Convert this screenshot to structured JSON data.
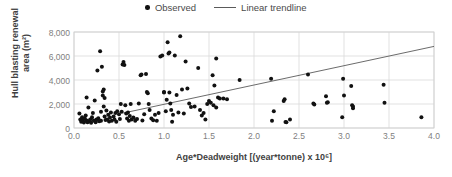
{
  "legend": {
    "position": "top-center",
    "entries": [
      {
        "label": "Observed",
        "marker": "dot",
        "color": "#111111",
        "icon": "scatter-dot-icon"
      },
      {
        "label": "Linear trendline",
        "marker": "line",
        "color": "#5a5a5a",
        "icon": "trendline-icon"
      }
    ]
  },
  "axes": {
    "x": {
      "label": "Age*Deadweight [(year*tonne) x 10⁶]",
      "ticks": [
        "0.0",
        "0.5",
        "1.0",
        "1.5",
        "2.0",
        "2.5",
        "3.0",
        "3.5",
        "4.0"
      ],
      "min": 0.0,
      "max": 4.0
    },
    "y": {
      "label": "Hull blasting renewal area (m²)",
      "ticks": [
        "0",
        "2,000",
        "4,000",
        "6,000",
        "8,000"
      ],
      "min": 0,
      "max": 8000
    }
  },
  "colors": {
    "marker": "#111111",
    "trendline": "#5a5a5a",
    "grid": "#d9d9d9",
    "plot_border": "#d0d0d0",
    "tick_text": "#808080",
    "axis_title": "#3f3f3f",
    "background": "#ffffff"
  },
  "chart_data": {
    "type": "scatter",
    "title": "",
    "xlabel": "Age*Deadweight [(year*tonne) x 10⁶]",
    "ylabel": "Hull blasting renewal area (m²)",
    "xlim": [
      0.0,
      4.0
    ],
    "ylim": [
      0,
      8000
    ],
    "grid": true,
    "legend_position": "top-center",
    "series": [
      {
        "name": "Observed",
        "type": "scatter",
        "marker": "dot",
        "color": "#111111",
        "points": [
          [
            0.06,
            1200
          ],
          [
            0.07,
            700
          ],
          [
            0.08,
            520
          ],
          [
            0.09,
            900
          ],
          [
            0.1,
            600
          ],
          [
            0.11,
            450
          ],
          [
            0.12,
            800
          ],
          [
            0.13,
            1050
          ],
          [
            0.14,
            2550
          ],
          [
            0.14,
            620
          ],
          [
            0.15,
            480
          ],
          [
            0.16,
            1700
          ],
          [
            0.17,
            560
          ],
          [
            0.18,
            700
          ],
          [
            0.19,
            430
          ],
          [
            0.2,
            900
          ],
          [
            0.21,
            1250
          ],
          [
            0.22,
            620
          ],
          [
            0.23,
            2300
          ],
          [
            0.24,
            480
          ],
          [
            0.25,
            700
          ],
          [
            0.26,
            4800
          ],
          [
            0.27,
            820
          ],
          [
            0.28,
            560
          ],
          [
            0.29,
            6400
          ],
          [
            0.3,
            1350
          ],
          [
            0.3,
            600
          ],
          [
            0.31,
            5100
          ],
          [
            0.32,
            2700
          ],
          [
            0.32,
            3050
          ],
          [
            0.33,
            3200
          ],
          [
            0.33,
            1800
          ],
          [
            0.34,
            2500
          ],
          [
            0.34,
            950
          ],
          [
            0.35,
            660
          ],
          [
            0.36,
            1450
          ],
          [
            0.37,
            700
          ],
          [
            0.38,
            1100
          ],
          [
            0.39,
            540
          ],
          [
            0.4,
            880
          ],
          [
            0.41,
            1300
          ],
          [
            0.42,
            600
          ],
          [
            0.44,
            950
          ],
          [
            0.45,
            700
          ],
          [
            0.46,
            1250
          ],
          [
            0.47,
            520
          ],
          [
            0.48,
            1400
          ],
          [
            0.5,
            1150
          ],
          [
            0.51,
            760
          ],
          [
            0.52,
            2000
          ],
          [
            0.53,
            1350
          ],
          [
            0.54,
            5300
          ],
          [
            0.55,
            5500
          ],
          [
            0.56,
            5250
          ],
          [
            0.57,
            1900
          ],
          [
            0.58,
            1200
          ],
          [
            0.59,
            800
          ],
          [
            0.6,
            1300
          ],
          [
            0.61,
            600
          ],
          [
            0.62,
            1000
          ],
          [
            0.63,
            2000
          ],
          [
            0.64,
            700
          ],
          [
            0.66,
            880
          ],
          [
            0.68,
            600
          ],
          [
            0.7,
            750
          ],
          [
            0.72,
            2050
          ],
          [
            0.74,
            4400
          ],
          [
            0.75,
            4450
          ],
          [
            0.76,
            620
          ],
          [
            0.78,
            1150
          ],
          [
            0.8,
            4500
          ],
          [
            0.81,
            3000
          ],
          [
            0.82,
            2900
          ],
          [
            0.83,
            2000
          ],
          [
            0.84,
            1500
          ],
          [
            0.86,
            800
          ],
          [
            0.88,
            650
          ],
          [
            0.9,
            1100
          ],
          [
            0.92,
            600
          ],
          [
            0.94,
            1250
          ],
          [
            0.96,
            5950
          ],
          [
            0.98,
            6050
          ],
          [
            1.0,
            2950
          ],
          [
            1.0,
            3000
          ],
          [
            1.02,
            1400
          ],
          [
            1.03,
            2350
          ],
          [
            1.04,
            7150
          ],
          [
            1.05,
            6200
          ],
          [
            1.06,
            6300
          ],
          [
            1.06,
            2950
          ],
          [
            1.07,
            2050
          ],
          [
            1.08,
            1500
          ],
          [
            1.09,
            520
          ],
          [
            1.1,
            1100
          ],
          [
            1.12,
            6050
          ],
          [
            1.14,
            2750
          ],
          [
            1.16,
            1300
          ],
          [
            1.18,
            7650
          ],
          [
            1.2,
            3200
          ],
          [
            1.22,
            1200
          ],
          [
            1.24,
            5550
          ],
          [
            1.26,
            3300
          ],
          [
            1.28,
            2050
          ],
          [
            1.3,
            1750
          ],
          [
            1.34,
            1800
          ],
          [
            1.38,
            5000
          ],
          [
            1.4,
            1500
          ],
          [
            1.42,
            1050
          ],
          [
            1.44,
            1250
          ],
          [
            1.46,
            700
          ],
          [
            1.48,
            2000
          ],
          [
            1.5,
            2250
          ],
          [
            1.52,
            2100
          ],
          [
            1.54,
            4400
          ],
          [
            1.55,
            1900
          ],
          [
            1.56,
            3550
          ],
          [
            1.58,
            5800
          ],
          [
            1.58,
            1700
          ],
          [
            1.6,
            2550
          ],
          [
            1.62,
            2450
          ],
          [
            1.66,
            2450
          ],
          [
            1.7,
            2400
          ],
          [
            1.84,
            4000
          ],
          [
            2.19,
            4100
          ],
          [
            2.2,
            600
          ],
          [
            2.22,
            1400
          ],
          [
            2.33,
            2250
          ],
          [
            2.34,
            2400
          ],
          [
            2.35,
            500
          ],
          [
            2.36,
            480
          ],
          [
            2.4,
            700
          ],
          [
            2.6,
            4450
          ],
          [
            2.66,
            2050
          ],
          [
            2.67,
            1950
          ],
          [
            2.8,
            2650
          ],
          [
            2.81,
            2100
          ],
          [
            2.82,
            2150
          ],
          [
            2.98,
            900
          ],
          [
            2.99,
            4100
          ],
          [
            3.0,
            2700
          ],
          [
            3.08,
            3500
          ],
          [
            3.09,
            1900
          ],
          [
            3.1,
            1650
          ],
          [
            3.1,
            1800
          ],
          [
            3.44,
            3600
          ],
          [
            3.45,
            2100
          ],
          [
            3.86,
            900
          ]
        ]
      },
      {
        "name": "Linear trendline",
        "type": "line",
        "color": "#5a5a5a",
        "endpoints": [
          [
            0.55,
            1250
          ],
          [
            4.0,
            6800
          ]
        ],
        "slope": 1609,
        "intercept": 365
      }
    ]
  }
}
